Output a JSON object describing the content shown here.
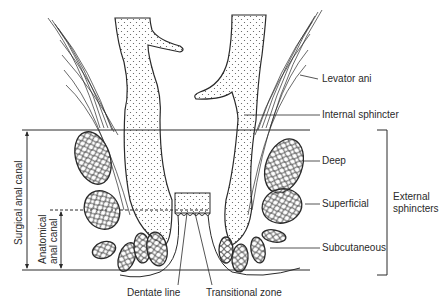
{
  "diagram": {
    "labels": {
      "levator_ani": "Levator ani",
      "internal_sphincter": "Internal sphincter",
      "deep": "Deep",
      "superficial": "Superficial",
      "subcutaneous": "Subcutaneous",
      "external_sphincters_line1": "External",
      "external_sphincters_line2": "sphincters",
      "dentate_line": "Dentate line",
      "transitional_zone": "Transitional zone",
      "surgical_anal_canal": "Surgical anal canal",
      "anatomical_anal_canal_line1": "Anatomical",
      "anatomical_anal_canal_line2": "anal canal"
    },
    "colors": {
      "line": "#2a2a2a",
      "background": "#ffffff"
    }
  }
}
